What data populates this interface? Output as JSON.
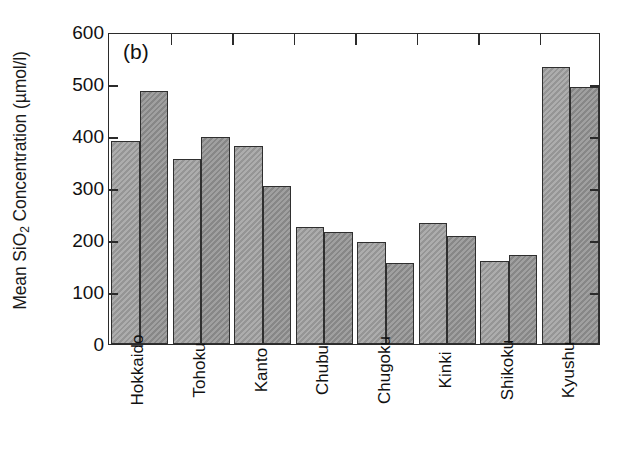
{
  "figure": {
    "panel_label": "(b)",
    "ylabel_prefix": "Mean SiO",
    "ylabel_sub": "2",
    "ylabel_suffix": " Concentration (µmol/l)"
  },
  "chart_data": {
    "type": "bar",
    "title": "(b)",
    "xlabel": "",
    "ylabel": "Mean SiO2 Concentration (µmol/l)",
    "ylim": [
      0,
      600
    ],
    "ytick_labels": [
      "0",
      "100",
      "200",
      "300",
      "400",
      "500",
      "600"
    ],
    "yticks": [
      0,
      100,
      200,
      300,
      400,
      500,
      600
    ],
    "grid": false,
    "legend": "none",
    "categories": [
      "Hokkaido",
      "Tohoku",
      "Kanto",
      "Chubu",
      "Chugoku",
      "Kinki",
      "Shikoku",
      "Kyushu"
    ],
    "series": [
      {
        "name": "series-1",
        "color": "#9d9d9d",
        "values": [
          390,
          355,
          380,
          225,
          197,
          233,
          159,
          532
        ]
      },
      {
        "name": "series-2",
        "color": "#8e8e8e",
        "values": [
          487,
          398,
          303,
          216,
          156,
          208,
          172,
          494
        ]
      }
    ]
  }
}
